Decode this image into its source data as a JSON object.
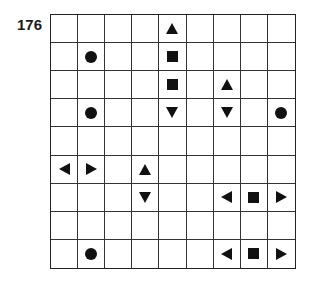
{
  "puzzle": {
    "number": "176",
    "rows": 9,
    "cols": 9,
    "symbols": [
      {
        "row": 0,
        "col": 4,
        "type": "triangle-up"
      },
      {
        "row": 1,
        "col": 1,
        "type": "circle"
      },
      {
        "row": 1,
        "col": 4,
        "type": "square"
      },
      {
        "row": 2,
        "col": 4,
        "type": "square"
      },
      {
        "row": 2,
        "col": 6,
        "type": "triangle-up"
      },
      {
        "row": 3,
        "col": 1,
        "type": "circle"
      },
      {
        "row": 3,
        "col": 4,
        "type": "triangle-down"
      },
      {
        "row": 3,
        "col": 6,
        "type": "triangle-down"
      },
      {
        "row": 3,
        "col": 8,
        "type": "circle"
      },
      {
        "row": 5,
        "col": 0,
        "type": "triangle-left"
      },
      {
        "row": 5,
        "col": 1,
        "type": "triangle-right"
      },
      {
        "row": 5,
        "col": 3,
        "type": "triangle-up"
      },
      {
        "row": 6,
        "col": 3,
        "type": "triangle-down"
      },
      {
        "row": 6,
        "col": 6,
        "type": "triangle-left"
      },
      {
        "row": 6,
        "col": 7,
        "type": "square"
      },
      {
        "row": 6,
        "col": 8,
        "type": "triangle-right"
      },
      {
        "row": 8,
        "col": 1,
        "type": "circle"
      },
      {
        "row": 8,
        "col": 6,
        "type": "triangle-left"
      },
      {
        "row": 8,
        "col": 7,
        "type": "square"
      },
      {
        "row": 8,
        "col": 8,
        "type": "triangle-right"
      }
    ]
  }
}
